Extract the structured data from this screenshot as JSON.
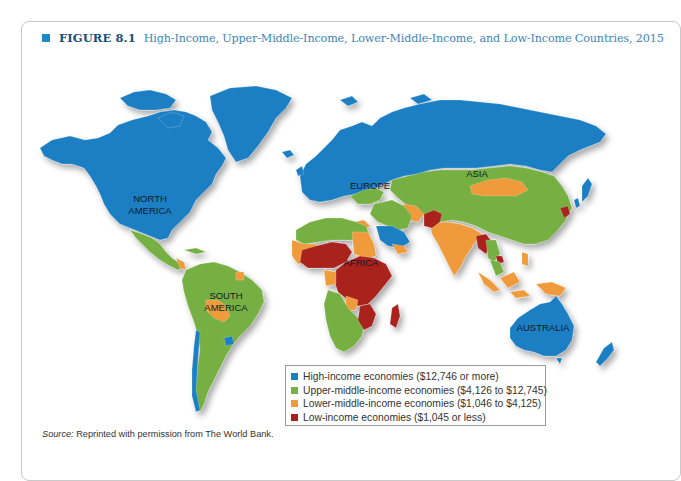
{
  "figure": {
    "label": "FIGURE 8.1",
    "caption": "High-Income, Upper-Middle-Income, Lower-Middle-Income, and Low-Income Countries, 2015",
    "icon": "square-bullet-icon",
    "accent_color": "#1e88c7"
  },
  "map": {
    "continent_labels": {
      "north_america_1": "NORTH",
      "north_america_2": "AMERICA",
      "south_america_1": "SOUTH",
      "south_america_2": "AMERICA",
      "europe": "EUROPE",
      "asia": "ASIA",
      "africa": "AFRICA",
      "australia": "AUSTRALIA"
    },
    "colors": {
      "high": "#1b7fc4",
      "upper_middle": "#77b043",
      "lower_middle": "#ef9a3a",
      "low": "#a9211d"
    }
  },
  "legend": {
    "items": [
      {
        "label": "High-income economies ($12,746 or more)",
        "color": "#1b7fc4"
      },
      {
        "label": "Upper-middle-income economies ($4,126 to $12,745)",
        "color": "#77b043"
      },
      {
        "label": "Lower-middle-income economies ($1,046 to $4,125)",
        "color": "#ef9a3a"
      },
      {
        "label": "Low-income economies ($1,045 or less)",
        "color": "#a9211d"
      }
    ]
  },
  "source": {
    "prefix": "Source:",
    "text": " Reprinted with permission from The World Bank."
  }
}
